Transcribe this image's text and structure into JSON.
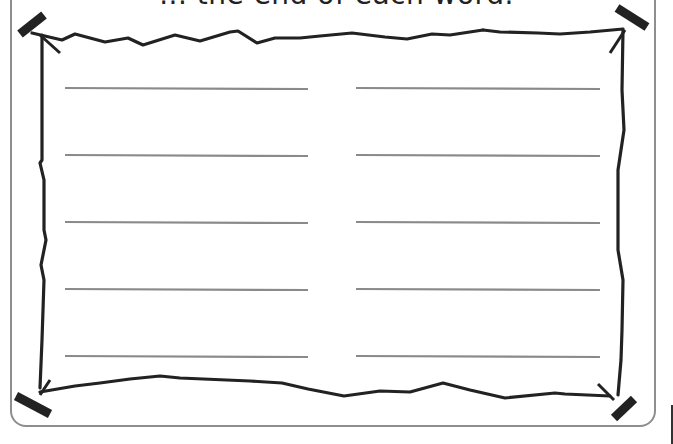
{
  "worksheet": {
    "instruction_text": "... the end of each word.",
    "answer_columns": 2,
    "answer_rows": 5,
    "answer_lines": [
      {
        "column": "left",
        "row": 1,
        "value": ""
      },
      {
        "column": "left",
        "row": 2,
        "value": ""
      },
      {
        "column": "left",
        "row": 3,
        "value": ""
      },
      {
        "column": "left",
        "row": 4,
        "value": ""
      },
      {
        "column": "left",
        "row": 5,
        "value": ""
      },
      {
        "column": "right",
        "row": 1,
        "value": ""
      },
      {
        "column": "right",
        "row": 2,
        "value": ""
      },
      {
        "column": "right",
        "row": 3,
        "value": ""
      },
      {
        "column": "right",
        "row": 4,
        "value": ""
      },
      {
        "column": "right",
        "row": 5,
        "value": ""
      }
    ],
    "decoration": "scroll-frame-with-pins",
    "colors": {
      "frame_border": "#8e8e8e",
      "writing_line": "#8a8a8a",
      "scroll_ink": "#222222"
    }
  }
}
